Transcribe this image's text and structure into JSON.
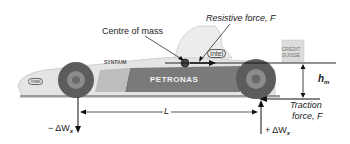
{
  "diagram": {
    "labels": {
      "centre_of_mass": "Centre of mass",
      "resistive_force": "Resistive force, F",
      "cg_height_symbol": "h",
      "cg_height_sub": "m",
      "traction_line1": "Traction",
      "traction_line2": "force, F",
      "wheelbase": "L",
      "front_load": "− ΔW",
      "front_load_sub": "x",
      "rear_load": "+ ΔW",
      "rear_load_sub": "x"
    },
    "sponsors": {
      "sidepod": "PETRONAS",
      "nose": "Intel",
      "engine_cover": "Intel",
      "sidepod_front": "SYNTIUM",
      "rear": "CREDIT SUISSE"
    },
    "colors": {
      "line": "#111111",
      "car_body": "#d9d9d9",
      "car_dark": "#6a6a6a",
      "tyre": "#5a5a5a"
    }
  }
}
